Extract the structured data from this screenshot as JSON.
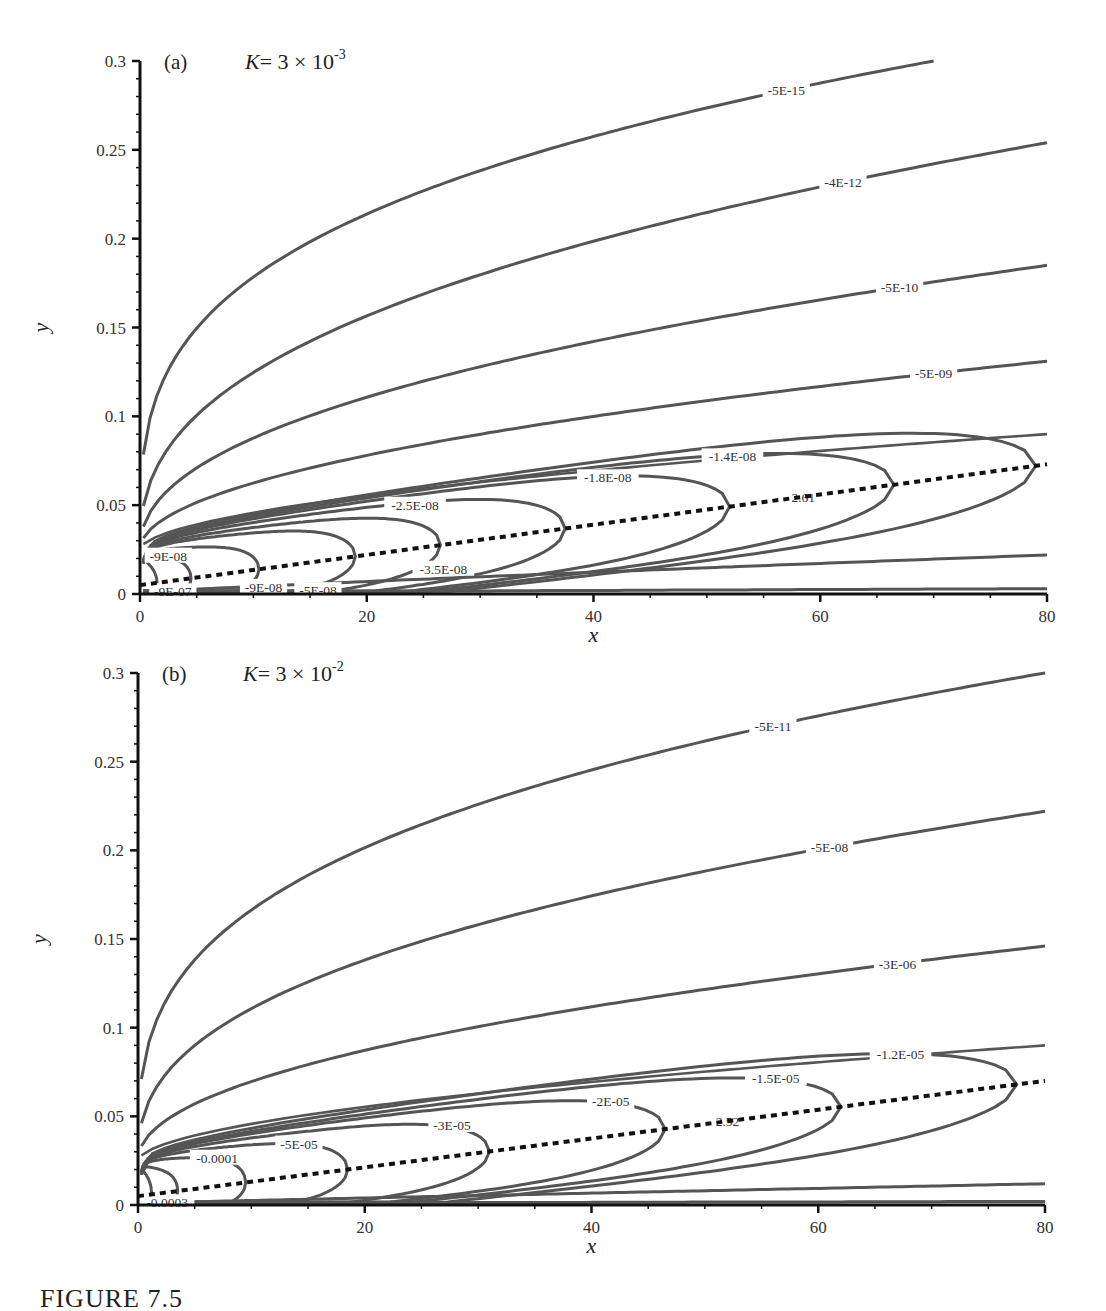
{
  "caption": "FIGURE 7.5",
  "chart_data": [
    {
      "type": "contour",
      "panel_tag": "(a)",
      "parameter": {
        "symbol": "K",
        "text": "= 3 × 10",
        "exponent": "-3"
      },
      "xlabel": "x",
      "ylabel": "y",
      "xlim": [
        0,
        80
      ],
      "ylim": [
        0,
        0.3
      ],
      "xticks": [
        0,
        20,
        40,
        60,
        80
      ],
      "yticks": [
        0,
        0.05,
        0.1,
        0.15,
        0.2,
        0.25,
        0.3
      ],
      "grid": false,
      "dotted_line": {
        "label": "2.61",
        "x_start": 0,
        "y_start": 0.005,
        "x_end": 80,
        "y_end": 0.073,
        "label_x": 58.5
      },
      "open_contours": [
        {
          "label": "-5E-15",
          "x_end": 70,
          "y_end": 0.3,
          "y_at_80": 0.3,
          "label_x": 57,
          "shape": 0.3
        },
        {
          "label": "-4E-12",
          "y_at_80": 0.254,
          "label_x": 62,
          "shape": 0.4
        },
        {
          "label": "-5E-10",
          "y_at_80": 0.185,
          "label_x": 67,
          "shape": 0.45
        },
        {
          "label": "-5E-09",
          "y_at_80": 0.131,
          "label_x": 70,
          "shape": 0.5
        },
        {
          "label": "",
          "y_at_80": 0.022,
          "shape": 0.9,
          "lower": true
        },
        {
          "label": "",
          "y_at_80": 0.003,
          "shape": 1.0,
          "lower": true
        }
      ],
      "closed_contours": [
        {
          "label": "-9E-07",
          "tip_x": 1.5,
          "half_width": 0.005,
          "label_x": 1.2,
          "label_side": "lower"
        },
        {
          "label": "-9E-08",
          "tip_x": 4.5,
          "half_width": 0.009,
          "label_x": 0.8,
          "label_side": "upper"
        },
        {
          "label": "-9E-08",
          "tip_x": 10.5,
          "half_width": 0.013,
          "label_x": 9.2,
          "label_side": "lower"
        },
        {
          "label": "-5E-08",
          "tip_x": 19,
          "half_width": 0.018,
          "label_x": 14,
          "label_side": "lower"
        },
        {
          "label": "-3.5E-08",
          "tip_x": 26.5,
          "half_width": 0.021,
          "label_x": 24.5,
          "label_side": "lower"
        },
        {
          "label": "-2.5E-08",
          "tip_x": 37.5,
          "half_width": 0.025,
          "label_x": 22,
          "label_side": "upper"
        },
        {
          "label": "-1.8E-08",
          "tip_x": 52,
          "half_width": 0.029,
          "label_x": 39,
          "label_side": "upper"
        },
        {
          "label": "-1.4E-08",
          "tip_x": 66.5,
          "half_width": 0.032,
          "label_x": 50,
          "label_side": "upper"
        },
        {
          "label": "",
          "tip_x": 79,
          "half_width": 0.035,
          "label_x": 0,
          "label_side": "none"
        }
      ]
    },
    {
      "type": "contour",
      "panel_tag": "(b)",
      "parameter": {
        "symbol": "K",
        "text": "= 3 × 10",
        "exponent": "-2"
      },
      "xlabel": "x",
      "ylabel": "y",
      "xlim": [
        0,
        80
      ],
      "ylim": [
        0,
        0.3
      ],
      "xticks": [
        0,
        20,
        40,
        60,
        80
      ],
      "yticks": [
        0,
        0.05,
        0.1,
        0.15,
        0.2,
        0.25,
        0.3
      ],
      "grid": false,
      "dotted_line": {
        "label": "2.52",
        "x_start": 0,
        "y_start": 0.005,
        "x_end": 80,
        "y_end": 0.07,
        "label_x": 52
      },
      "open_contours": [
        {
          "label": "-5E-11",
          "y_at_80": 0.3,
          "label_x": 56,
          "shape": 0.32
        },
        {
          "label": "-5E-08",
          "y_at_80": 0.222,
          "label_x": 61,
          "shape": 0.4
        },
        {
          "label": "-3E-06",
          "y_at_80": 0.146,
          "label_x": 67,
          "shape": 0.48
        },
        {
          "label": "",
          "y_at_80": 0.012,
          "shape": 0.95,
          "lower": true
        },
        {
          "label": "",
          "y_at_80": 0.002,
          "shape": 1.0,
          "lower": true
        }
      ],
      "closed_contours": [
        {
          "label": "-0.0003",
          "tip_x": 1.2,
          "half_width": 0.006,
          "label_x": 0.6,
          "label_side": "lower"
        },
        {
          "label": "",
          "tip_x": 3.5,
          "half_width": 0.009,
          "label_x": 0,
          "label_side": "none"
        },
        {
          "label": "-0.0001",
          "tip_x": 9.5,
          "half_width": 0.014,
          "label_x": 5,
          "label_side": "upper"
        },
        {
          "label": "-5E-05",
          "tip_x": 18.5,
          "half_width": 0.018,
          "label_x": 12.5,
          "label_side": "upper"
        },
        {
          "label": "-3E-05",
          "tip_x": 31,
          "half_width": 0.022,
          "label_x": 26,
          "label_side": "upper"
        },
        {
          "label": "-2E-05",
          "tip_x": 46.5,
          "half_width": 0.026,
          "label_x": 40,
          "label_side": "upper"
        },
        {
          "label": "-1.5E-05",
          "tip_x": 62,
          "half_width": 0.029,
          "label_x": 54,
          "label_side": "upper"
        },
        {
          "label": "-1.2E-05",
          "tip_x": 77.5,
          "half_width": 0.033,
          "label_x": 65,
          "label_side": "upper"
        }
      ]
    }
  ],
  "colors": {
    "contour": "#555555",
    "axis": "#111111",
    "dotted": "#111111",
    "text": "#222222"
  }
}
